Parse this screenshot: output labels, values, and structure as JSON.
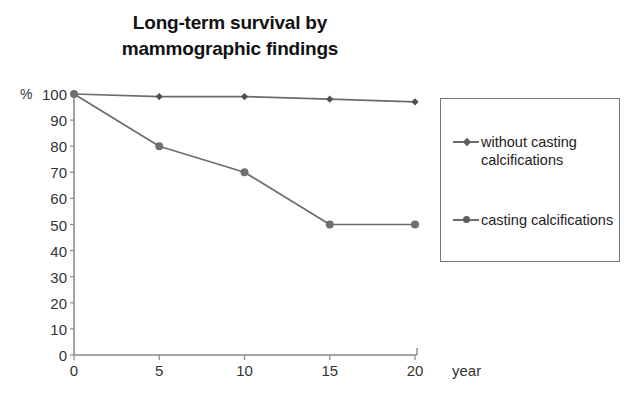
{
  "chart_data": {
    "type": "line",
    "title": "Long-term survival by mammographic findings",
    "title_lines": [
      "Long-term survival by",
      "mammographic findings"
    ],
    "xlabel": "year",
    "ylabel": "%",
    "y_unit_label": "% 100",
    "xlim": [
      0,
      20
    ],
    "ylim": [
      0,
      100
    ],
    "x": [
      0,
      5,
      10,
      15,
      20
    ],
    "xticks": [
      "0",
      "5",
      "10",
      "15",
      "20"
    ],
    "yticks": [
      "100",
      "90",
      "80",
      "70",
      "60",
      "50",
      "40",
      "30",
      "20",
      "10",
      "0"
    ],
    "grid": false,
    "legend_position": "right",
    "series": [
      {
        "name": "without casting calcifications",
        "name_lines": [
          "without casting",
          "calcifications"
        ],
        "marker": "diamond",
        "color": "#6b6b6b",
        "values": [
          100,
          99,
          99,
          98,
          97
        ]
      },
      {
        "name": "casting calcifications",
        "name_lines": [
          "casting calcifications"
        ],
        "marker": "circle",
        "color": "#6b6b6b",
        "values": [
          100,
          80,
          70,
          50,
          50
        ]
      }
    ]
  },
  "axes": {
    "axis_color": "#8a8a8a",
    "tick_color": "#8a8a8a",
    "text_color": "#333333"
  },
  "legend": {
    "border_color": "#777777",
    "entries": [
      {
        "label": "without casting\ncalcifications"
      },
      {
        "label": "casting calcifications"
      }
    ]
  }
}
